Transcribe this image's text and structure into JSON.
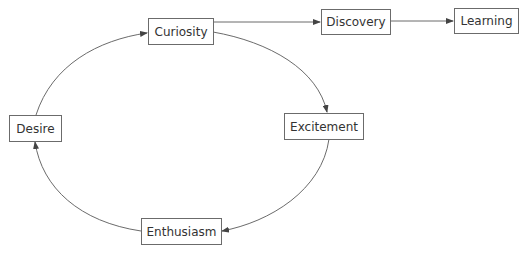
{
  "diagram": {
    "type": "cycle-with-branch",
    "colors": {
      "stroke": "#6b6b6b",
      "text": "#333333",
      "background": "#ffffff"
    },
    "nodes": [
      {
        "id": "curiosity",
        "label": "Curiosity"
      },
      {
        "id": "excitement",
        "label": "Excitement"
      },
      {
        "id": "enthusiasm",
        "label": "Enthusiasm"
      },
      {
        "id": "desire",
        "label": "Desire"
      },
      {
        "id": "discovery",
        "label": "Discovery"
      },
      {
        "id": "learning",
        "label": "Learning"
      }
    ],
    "edges": [
      {
        "from": "curiosity",
        "to": "excitement",
        "style": "curved"
      },
      {
        "from": "excitement",
        "to": "enthusiasm",
        "style": "curved"
      },
      {
        "from": "enthusiasm",
        "to": "desire",
        "style": "curved"
      },
      {
        "from": "desire",
        "to": "curiosity",
        "style": "curved"
      },
      {
        "from": "curiosity",
        "to": "discovery",
        "style": "straight"
      },
      {
        "from": "discovery",
        "to": "learning",
        "style": "straight"
      }
    ]
  }
}
